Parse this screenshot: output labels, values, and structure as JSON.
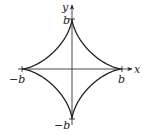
{
  "diagram": {
    "type": "astroid",
    "equation": "x^(2/3) + y^(2/3) = b^(2/3)",
    "axes": {
      "x_label": "x",
      "y_label": "y"
    },
    "ticks": {
      "x_pos": "b",
      "x_neg": "−b",
      "y_pos": "b",
      "y_neg": "−b"
    },
    "colors": {
      "curve": "#222222",
      "axis": "#333333",
      "background": "#ffffff"
    }
  }
}
